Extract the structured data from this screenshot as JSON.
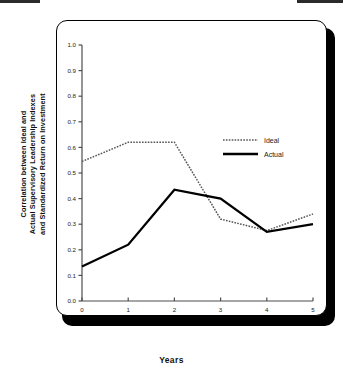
{
  "figure": {
    "x_axis_title": "Years",
    "y_axis_title_lines": [
      "Correlation between Ideal and",
      "Actual Supervisory Leadership Indexes",
      "and Standardized Return on Investment"
    ],
    "legend": {
      "ideal_label": "Ideal",
      "actual_label": "Actual"
    },
    "colors": {
      "ideal": "#555555",
      "actual": "#000000",
      "axis": "#4d4d4d",
      "frame": "#000000",
      "shadow": "#000000",
      "background": "#ffffff"
    }
  },
  "chart_data": {
    "type": "line",
    "title": "",
    "xlabel": "Years",
    "ylabel": "Correlation between Ideal and Actual Supervisory Leadership Indexes and Standardized Return on Investment",
    "x": [
      0,
      1,
      2,
      3,
      4,
      5
    ],
    "xticklabels": [
      "0",
      "1",
      "2",
      "3",
      "4",
      "5"
    ],
    "yticklabels": [
      "0.0",
      "0.1",
      "0.2",
      "0.3",
      "0.4",
      "0.5",
      "0.6",
      "0.7",
      "0.8",
      "0.9",
      "1.0"
    ],
    "xlim": [
      0,
      5
    ],
    "ylim": [
      0.0,
      1.0
    ],
    "grid": false,
    "legend_position": "upper right inside",
    "series": [
      {
        "name": "Ideal",
        "style": "dotted",
        "values": [
          0.545,
          0.62,
          0.62,
          0.32,
          0.275,
          0.34
        ]
      },
      {
        "name": "Actual",
        "style": "solid",
        "values": [
          0.135,
          0.22,
          0.435,
          0.4,
          0.27,
          0.3
        ]
      }
    ]
  }
}
